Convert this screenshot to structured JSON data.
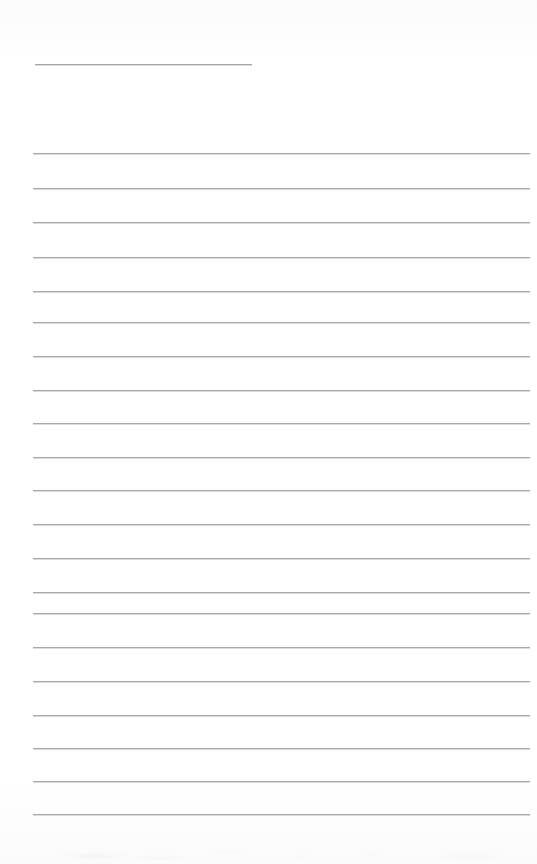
{
  "document": {
    "type": "scanned-ruled-notepaper",
    "title": "Blank Ruled Note Page",
    "page_width": 537,
    "page_height": 864,
    "background_color": "#ffffff",
    "content_text": "",
    "is_blank": true
  },
  "styles": {
    "rule_color": "#a9a9ab",
    "rule_highlight_color": "#bebec1",
    "short_rule_color": "#a6a6a9",
    "rule_thickness_px": 1
  },
  "layout": {
    "left_margin_px": 33,
    "right_edge_px": 530,
    "rule_width_px": 497,
    "first_rule_y_px": 153,
    "last_rule_y_px": 814,
    "rule_spacing_px": 34.8,
    "rule_count": 20
  },
  "short_rule": {
    "name": "heading-rule",
    "x": 35,
    "y": 64,
    "width": 217,
    "label": ""
  },
  "rules": [
    {
      "index": 1,
      "y": 153,
      "x": 33,
      "width": 497
    },
    {
      "index": 2,
      "y": 188,
      "x": 33,
      "width": 497
    },
    {
      "index": 3,
      "y": 222,
      "x": 33,
      "width": 497
    },
    {
      "index": 4,
      "y": 257,
      "x": 33,
      "width": 497
    },
    {
      "index": 5,
      "y": 291,
      "x": 33,
      "width": 497
    },
    {
      "index": 6,
      "y": 322,
      "x": 33,
      "width": 497
    },
    {
      "index": 7,
      "y": 356,
      "x": 33,
      "width": 497
    },
    {
      "index": 8,
      "y": 390,
      "x": 33,
      "width": 497
    },
    {
      "index": 9,
      "y": 423,
      "x": 33,
      "width": 497
    },
    {
      "index": 10,
      "y": 457,
      "x": 33,
      "width": 497
    },
    {
      "index": 11,
      "y": 490,
      "x": 33,
      "width": 497
    },
    {
      "index": 12,
      "y": 524,
      "x": 33,
      "width": 497
    },
    {
      "index": 13,
      "y": 558,
      "x": 33,
      "width": 497
    },
    {
      "index": 14,
      "y": 592,
      "x": 33,
      "width": 497
    },
    {
      "index": 15,
      "y": 613,
      "x": 33,
      "width": 497
    },
    {
      "index": 16,
      "y": 647,
      "x": 33,
      "width": 497
    },
    {
      "index": 17,
      "y": 681,
      "x": 33,
      "width": 497
    },
    {
      "index": 18,
      "y": 715,
      "x": 33,
      "width": 497
    },
    {
      "index": 19,
      "y": 748,
      "x": 33,
      "width": 497
    },
    {
      "index": 20,
      "y": 781,
      "x": 33,
      "width": 497
    },
    {
      "index": 21,
      "y": 814,
      "x": 33,
      "width": 497
    }
  ]
}
